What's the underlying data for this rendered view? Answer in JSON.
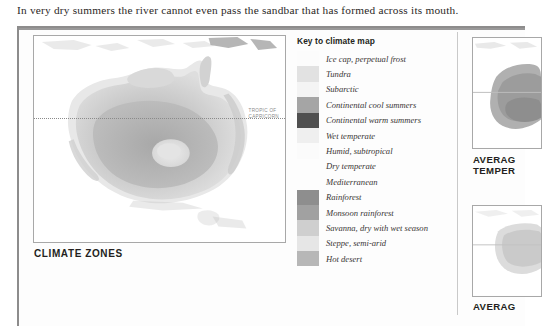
{
  "caption": {
    "text": "In very dry summers the river cannot even pass the sandbar that has formed across its mouth."
  },
  "main_map": {
    "title": "CLIMATE ZONES",
    "tropic_label": "TROPIC OF\nCAPRICORN",
    "subject": "australia-climate-zones-map"
  },
  "key": {
    "title": "Key to climate map",
    "items": [
      {
        "label": "Ice cap, perpetual frost",
        "color": "#fcfcfc"
      },
      {
        "label": "Tundra",
        "color": "#e2e2e2"
      },
      {
        "label": "Subarctic",
        "color": "#f4f4f4"
      },
      {
        "label": "Continental cool summers",
        "color": "#a5a5a5"
      },
      {
        "label": "Continental warm summers",
        "color": "#4f4f4f"
      },
      {
        "label": "Wet temperate",
        "color": "#efefef"
      },
      {
        "label": "Humid, subtropical",
        "color": "#fbfbfb"
      },
      {
        "label": "Dry temperate",
        "color": "#fdfdfd"
      },
      {
        "label": "Mediterranean",
        "color": "#fdfdfd"
      },
      {
        "label": "Rainforest",
        "color": "#8e8e8e"
      },
      {
        "label": "Monsoon rainforest",
        "color": "#a1a1a1"
      },
      {
        "label": "Savanna, dry with wet season",
        "color": "#cfcfcf"
      },
      {
        "label": "Steppe, semi-arid",
        "color": "#e6e6e6"
      },
      {
        "label": "Hot desert",
        "color": "#b7b7b7"
      }
    ]
  },
  "side_panels": [
    {
      "caption": "AVERAG\nTEMPER",
      "subject": "average-temperature-map"
    },
    {
      "caption": "AVERAG",
      "subject": "average-rainfall-map"
    }
  ]
}
